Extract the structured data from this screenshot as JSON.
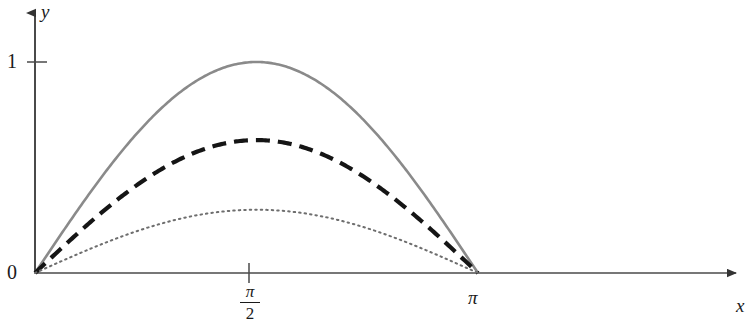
{
  "chart_data": {
    "type": "line",
    "title": "",
    "xlabel": "x",
    "ylabel": "y",
    "xlim": [
      0,
      4.85
    ],
    "ylim": [
      0,
      1.27
    ],
    "grid": false,
    "legend": "none",
    "x_ticks": [
      {
        "value": 1.5708,
        "label": "π/2",
        "label_numerator": "π",
        "label_denominator": "2"
      },
      {
        "value": 3.14159,
        "label": "π"
      }
    ],
    "y_ticks": [
      {
        "value": 0,
        "label": "0"
      },
      {
        "value": 1,
        "label": "1"
      }
    ],
    "axes_style": "arrowed-open",
    "series": [
      {
        "name": "solid-curve",
        "style": "solid",
        "color": "#8a8a8a",
        "width": 2.6,
        "function": "amplitude * sin(x)",
        "amplitude": 1.0,
        "x": [
          0,
          0.1571,
          0.3142,
          0.4712,
          0.6283,
          0.7854,
          0.9425,
          1.0996,
          1.2566,
          1.4137,
          1.5708,
          1.7279,
          1.885,
          2.042,
          2.1991,
          2.3562,
          2.5133,
          2.6704,
          2.8274,
          2.9845,
          3.1416
        ],
        "values": [
          0.0,
          0.156,
          0.309,
          0.454,
          0.588,
          0.707,
          0.809,
          0.891,
          0.951,
          0.988,
          1.0,
          0.988,
          0.951,
          0.891,
          0.809,
          0.707,
          0.588,
          0.454,
          0.309,
          0.156,
          0.0
        ]
      },
      {
        "name": "dashed-curve",
        "style": "dashed",
        "color": "#151515",
        "width": 4.2,
        "dash_pattern": "14 8",
        "function": "amplitude * sin(x)",
        "amplitude": 0.63,
        "x": [
          0,
          0.1571,
          0.3142,
          0.4712,
          0.6283,
          0.7854,
          0.9425,
          1.0996,
          1.2566,
          1.4137,
          1.5708,
          1.7279,
          1.885,
          2.042,
          2.1991,
          2.3562,
          2.5133,
          2.6704,
          2.8274,
          2.9845,
          3.1416
        ],
        "values": [
          0.0,
          0.098,
          0.195,
          0.286,
          0.37,
          0.445,
          0.51,
          0.561,
          0.599,
          0.622,
          0.63,
          0.622,
          0.599,
          0.561,
          0.51,
          0.445,
          0.37,
          0.286,
          0.195,
          0.098,
          0.0
        ]
      },
      {
        "name": "dotted-curve",
        "style": "dotted",
        "color": "#6e6e6e",
        "width": 2.0,
        "dash_pattern": "1.5 4",
        "function": "amplitude * sin(x)",
        "amplitude": 0.3,
        "x": [
          0,
          0.1571,
          0.3142,
          0.4712,
          0.6283,
          0.7854,
          0.9425,
          1.0996,
          1.2566,
          1.4137,
          1.5708,
          1.7279,
          1.885,
          2.042,
          2.1991,
          2.3562,
          2.5133,
          2.6704,
          2.8274,
          2.9845,
          3.1416
        ],
        "values": [
          0.0,
          0.047,
          0.093,
          0.136,
          0.176,
          0.212,
          0.243,
          0.267,
          0.285,
          0.296,
          0.3,
          0.296,
          0.285,
          0.267,
          0.243,
          0.212,
          0.176,
          0.136,
          0.093,
          0.047,
          0.0
        ]
      }
    ],
    "colors": {
      "axis": "#4a4a4a",
      "text": "#1a1a1a",
      "background": "#ffffff"
    }
  },
  "labels": {
    "y_axis": "y",
    "x_axis": "x",
    "tick_one": "1",
    "tick_zero": "0",
    "tick_pi": "π",
    "tick_pi_half_numerator": "π",
    "tick_pi_half_denominator": "2"
  }
}
